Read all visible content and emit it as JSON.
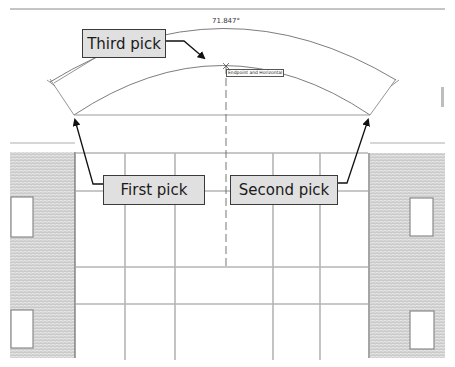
{
  "drawing": {
    "dimension_label": "71.847°",
    "snap_tooltip": "Endpoint and Horizontal",
    "colors": {
      "line": "#7a7a7a",
      "callout_fill": "#e0e0e0",
      "callout_border": "#3a3a3a",
      "brick": "#d8d8d8",
      "arrow": "#111111"
    }
  },
  "callouts": [
    {
      "id": "third",
      "label": "Third pick"
    },
    {
      "id": "first",
      "label": "First pick"
    },
    {
      "id": "second",
      "label": "Second pick"
    }
  ]
}
